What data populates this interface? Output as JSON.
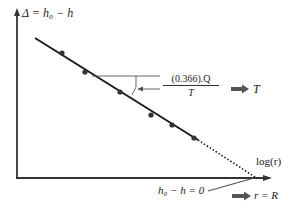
{
  "diagram": {
    "y_axis_label": "Δ = h₀ − h",
    "x_axis_label": "log(r)",
    "slope_label": {
      "numerator": "(0.366).Q",
      "denominator": "T"
    },
    "result_T": "T",
    "intercept_label": "h₀ − h = 0",
    "result_R": "r = R",
    "colors": {
      "line": "#1a1a1a",
      "axis": "#333333",
      "arrow": "#555555",
      "point": "#333333"
    },
    "data_points": [
      {
        "x": 62,
        "y": 53
      },
      {
        "x": 85,
        "y": 72
      },
      {
        "x": 120,
        "y": 92
      },
      {
        "x": 151,
        "y": 115
      },
      {
        "x": 172,
        "y": 125
      },
      {
        "x": 194,
        "y": 138
      }
    ]
  }
}
